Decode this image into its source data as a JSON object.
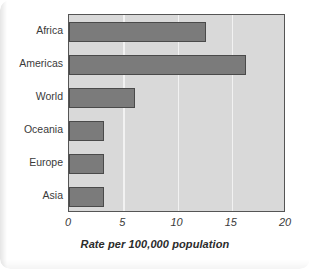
{
  "chart_data": {
    "type": "bar",
    "orientation": "horizontal",
    "title": "",
    "xlabel": "Rate per 100,000 population",
    "ylabel": "",
    "categories": [
      "Africa",
      "Americas",
      "World",
      "Oceania",
      "Europe",
      "Asia"
    ],
    "values": [
      12.6,
      16.3,
      6.1,
      3.2,
      3.2,
      3.2
    ],
    "xlim": [
      0,
      20
    ],
    "xticks": [
      0,
      5,
      10,
      15,
      20
    ],
    "xtick_labels": [
      "0",
      "5",
      "10",
      "15",
      "20"
    ],
    "grid": "vertical",
    "legend": "none",
    "bar_color": "#7b7b7b",
    "bar_border_color": "#4a4a4a",
    "plot_background": "#d9d9d9",
    "gridline_color": "#f2f2f2",
    "axis_border_color": "#555555"
  },
  "figure": {
    "caption": ""
  }
}
